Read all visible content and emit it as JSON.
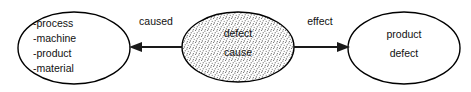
{
  "diagram": {
    "type": "cause-effect-flow",
    "background_color": "#ffffff",
    "stroke_color": "#000000",
    "text_color": "#111111",
    "nodes": [
      {
        "id": "causes",
        "shape": "ellipse",
        "fill": "white",
        "cx": 74,
        "cy": 48,
        "rx": 56,
        "ry": 36,
        "text_align": "left",
        "lines": [
          "-process",
          "-machine",
          "-product",
          "-material"
        ]
      },
      {
        "id": "defect-cause",
        "shape": "ellipse",
        "fill": "stipple",
        "cx": 238,
        "cy": 47,
        "rx": 56,
        "ry": 35,
        "text_align": "center",
        "lines": [
          "defect",
          "cause"
        ]
      },
      {
        "id": "product-defect",
        "shape": "ellipse",
        "fill": "white",
        "cx": 404,
        "cy": 48,
        "rx": 56,
        "ry": 36,
        "text_align": "center",
        "lines": [
          "product",
          "defect"
        ]
      }
    ],
    "edges": [
      {
        "id": "caused-edge",
        "label": "caused",
        "label_x": 156,
        "label_y": 25,
        "direction": "left",
        "from_x": 182,
        "to_x": 131,
        "y": 47
      },
      {
        "id": "effect-edge",
        "label": "effect",
        "label_x": 320,
        "label_y": 25,
        "direction": "right",
        "from_x": 294,
        "to_x": 348,
        "y": 47
      }
    ]
  }
}
